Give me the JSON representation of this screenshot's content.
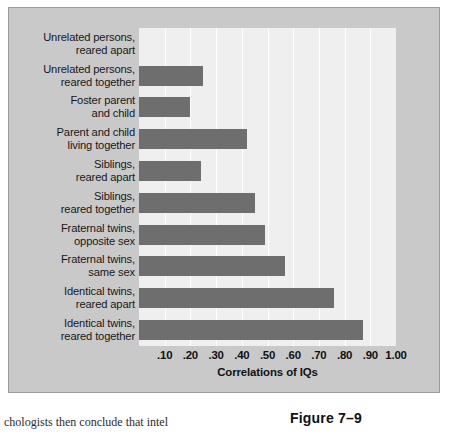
{
  "figure": {
    "number_label": "Figure 7–9",
    "body_text_fragment": "chologists then conclude that intel"
  },
  "chart_data": {
    "type": "bar",
    "orientation": "horizontal",
    "title": "",
    "xlabel": "Correlations of IQs",
    "ylabel": "",
    "xlim": [
      0,
      1.0
    ],
    "grid": true,
    "legend": false,
    "bar_color": "#6e6e6e",
    "plot_background": "#efefef",
    "panel_background": "#c9c9c9",
    "tick_labels": [
      ".10",
      ".20",
      ".30",
      ".40",
      ".50",
      ".60",
      ".70",
      ".80",
      ".90",
      "1.00"
    ],
    "ticks": [
      0.1,
      0.2,
      0.3,
      0.4,
      0.5,
      0.6,
      0.7,
      0.8,
      0.9,
      1.0
    ],
    "categories": [
      "Unrelated persons,\nreared apart",
      "Unrelated persons,\nreared together",
      "Foster parent\nand child",
      "Parent and child\nliving together",
      "Siblings,\nreared apart",
      "Siblings,\nreared together",
      "Fraternal twins,\nopposite sex",
      "Fraternal twins,\nsame sex",
      "Identical twins,\nreared apart",
      "Identical twins,\nreared together"
    ],
    "category_lines": [
      [
        "Unrelated persons,",
        "reared apart"
      ],
      [
        "Unrelated persons,",
        "reared together"
      ],
      [
        "Foster parent",
        "and child"
      ],
      [
        "Parent and child",
        "living together"
      ],
      [
        "Siblings,",
        "reared apart"
      ],
      [
        "Siblings,",
        "reared together"
      ],
      [
        "Fraternal twins,",
        "opposite sex"
      ],
      [
        "Fraternal twins,",
        "same sex"
      ],
      [
        "Identical twins,",
        "reared apart"
      ],
      [
        "Identical twins,",
        "reared together"
      ]
    ],
    "values": [
      0.0,
      0.25,
      0.2,
      0.42,
      0.24,
      0.45,
      0.49,
      0.57,
      0.76,
      0.87
    ]
  }
}
